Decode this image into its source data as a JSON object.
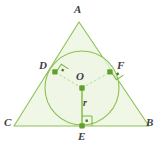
{
  "figure": {
    "type": "geometry-diagram",
    "colors": {
      "stroke": "#7cb342",
      "fill": "#f1f7e7",
      "point": "#5e9e2e",
      "dashed": "#a9cf86",
      "label": "#3f3f3f"
    }
  },
  "labels": {
    "apex": "A",
    "right_vertex": "B",
    "left_vertex": "C",
    "tangent_left": "D",
    "tangent_bottom": "E",
    "tangent_right": "F",
    "center": "O",
    "radius": "r"
  },
  "geometry": {
    "triangle": {
      "A": [
        79,
        22
      ],
      "B": [
        149,
        126
      ],
      "C": [
        14,
        126
      ]
    },
    "incircle": {
      "center": [
        82,
        88
      ],
      "radius": 37
    },
    "points": {
      "D": [
        55,
        72
      ],
      "E": [
        82,
        126
      ],
      "F": [
        110,
        72
      ],
      "O": [
        82,
        88
      ]
    },
    "radius_segment": {
      "from": [
        82,
        88
      ],
      "to": [
        82,
        126
      ]
    },
    "dashed_segments": [
      {
        "from": [
          82,
          88
        ],
        "to": [
          55,
          72
        ]
      },
      {
        "from": [
          82,
          88
        ],
        "to": [
          110,
          72
        ]
      }
    ],
    "right_angle_markers": [
      "D",
      "E",
      "F"
    ]
  },
  "label_positions": {
    "A": [
      74,
      4
    ],
    "B": [
      146,
      117
    ],
    "C": [
      4,
      117
    ],
    "D": [
      39,
      60
    ],
    "E": [
      78,
      131
    ],
    "F": [
      117,
      60
    ],
    "O": [
      76,
      71
    ],
    "r": [
      83,
      98
    ]
  }
}
